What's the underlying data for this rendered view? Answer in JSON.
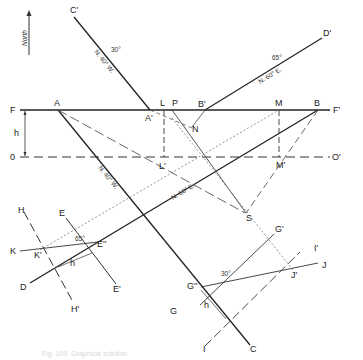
{
  "figure": {
    "north_label": "North",
    "caption": "Fig. 100. Graphical solution",
    "points": {
      "C_prime": "C'",
      "D_prime": "D'",
      "F": "F",
      "F_prime": "F'",
      "A": "A",
      "A_prime": "A'",
      "L": "L",
      "P": "P",
      "B_prime": "B'",
      "M": "M",
      "B": "B",
      "N": "N",
      "h_top": "h",
      "O": "0",
      "O_prime": "O'",
      "L_prime": "L'",
      "M_prime": "M'",
      "S": "S",
      "E": "E",
      "H": "H",
      "K": "K",
      "K_prime": "K'",
      "E_dbl": "E''",
      "h_left": "h",
      "D": "D",
      "E_prime": "E'",
      "H_prime": "H'",
      "G_prime": "G'",
      "I_prime": "I'",
      "J": "J",
      "G_dbl": "G''",
      "J_prime": "J'",
      "G": "G",
      "h_right": "h",
      "I": "I",
      "C": "C"
    },
    "annotations": {
      "bearing_c_upper": "N. 40° W.",
      "bearing_c_lower": "N. 40° W.",
      "bearing_d_upper": "N. 60° E.",
      "bearing_d_lower": "N. 60° E.",
      "dip_c": "30°",
      "dip_d": "65°",
      "angle_k": "65°",
      "angle_j": "30°"
    }
  }
}
